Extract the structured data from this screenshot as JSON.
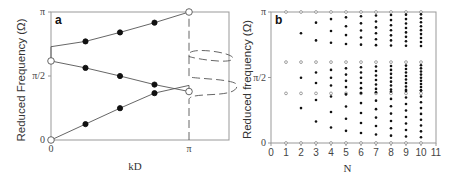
{
  "chart_data": [
    {
      "panel": "a",
      "type": "line",
      "title": "",
      "panel_label": "a",
      "xlabel": "kD",
      "ylabel": "Reduced Frequency (Ω)",
      "xticks": [
        "0",
        "π"
      ],
      "yticks": [
        "0",
        "π/2",
        "π"
      ],
      "xlim": [
        0,
        3.4
      ],
      "ylim": [
        0,
        3.1416
      ],
      "grid": false,
      "series": [
        {
          "name": "lower band",
          "x": [
            0,
            0.785,
            1.571,
            2.356,
            3.1416
          ],
          "y": [
            0,
            0.39,
            0.78,
            1.15,
            1.34
          ],
          "marker_points": [
            [
              0,
              0,
              "open"
            ],
            [
              0.785,
              0.39,
              "filled"
            ],
            [
              1.571,
              0.78,
              "filled"
            ],
            [
              2.356,
              1.15,
              "filled"
            ]
          ]
        },
        {
          "name": "middle band",
          "x": [
            0,
            0.785,
            1.571,
            2.356,
            3.1416
          ],
          "y": [
            1.94,
            1.77,
            1.57,
            1.36,
            1.19
          ],
          "marker_points": [
            [
              0,
              1.94,
              "open"
            ],
            [
              0.785,
              1.77,
              "filled"
            ],
            [
              1.571,
              1.57,
              "filled"
            ],
            [
              2.356,
              1.36,
              "filled"
            ],
            [
              3.1416,
              1.19,
              "open"
            ]
          ]
        },
        {
          "name": "upper band",
          "x": [
            0,
            0.785,
            1.571,
            2.356,
            3.1416
          ],
          "y": [
            2.29,
            2.42,
            2.64,
            2.88,
            3.1416
          ],
          "marker_points": [
            [
              0.785,
              2.42,
              "filled"
            ],
            [
              1.571,
              2.64,
              "filled"
            ],
            [
              2.356,
              2.88,
              "filled"
            ],
            [
              3.1416,
              3.1416,
              "open"
            ]
          ]
        }
      ],
      "annotations": [
        "dashed curve beyond kD = π showing evanescent branches in band gaps"
      ]
    },
    {
      "panel": "b",
      "type": "scatter",
      "title": "",
      "panel_label": "b",
      "xlabel": "N",
      "ylabel": "Reduced frequency (Ω)",
      "xticks": [
        "0",
        "1",
        "2",
        "3",
        "4",
        "5",
        "6",
        "7",
        "8",
        "9",
        "10",
        "11"
      ],
      "yticks": [
        "0",
        "π/2",
        "π"
      ],
      "xlim": [
        0,
        11
      ],
      "ylim": [
        0,
        3.1416
      ],
      "grid": false,
      "series": [
        {
          "name": "band-edge modes (open)",
          "description": "open circles at Ω=0, ≈1.19, ≈1.94, π for each N"
        },
        {
          "name": "interior modes (filled)",
          "counts_per_band_by_N": {
            "1": 0,
            "2": 1,
            "3": 2,
            "4": 3,
            "5": 4,
            "6": 5,
            "7": 6,
            "8": 7,
            "9": 8,
            "10": 9
          },
          "bands": [
            [
              0,
              1.34
            ],
            [
              1.19,
              1.94
            ],
            [
              2.29,
              3.1416
            ]
          ]
        }
      ]
    }
  ]
}
